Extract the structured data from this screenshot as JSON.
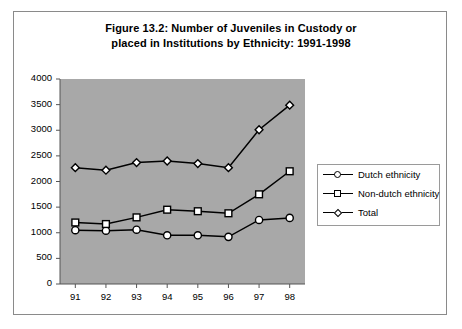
{
  "figure": {
    "title_line1": "Figure 13.2: Number of Juveniles in Custody or",
    "title_line2": "placed in Institutions by Ethnicity: 1991-1998"
  },
  "legend": {
    "position": "right-inside",
    "items": [
      {
        "label": "Dutch ethnicity",
        "marker": "circle"
      },
      {
        "label": "Non-dutch ethnicity",
        "marker": "square"
      },
      {
        "label": "Total",
        "marker": "diamond"
      }
    ]
  },
  "colors": {
    "plot_background": "#a8a8a8",
    "line": "#000000",
    "marker_fill": "#ffffff",
    "frame": "#8a8a8a",
    "text": "#000000"
  },
  "chart_data": {
    "type": "line",
    "title": "Figure 13.2: Number of Juveniles in Custody or placed in Institutions by Ethnicity: 1991-1998",
    "xlabel": "",
    "ylabel": "",
    "x": [
      "91",
      "92",
      "93",
      "94",
      "95",
      "96",
      "97",
      "98"
    ],
    "categories": [
      "91",
      "92",
      "93",
      "94",
      "95",
      "96",
      "97",
      "98"
    ],
    "tick_labels_y": [
      "0",
      "500",
      "1000",
      "1500",
      "2000",
      "2500",
      "3000",
      "3500",
      "4000"
    ],
    "ylim": [
      0,
      4000
    ],
    "ytick_step": 500,
    "grid": false,
    "series": [
      {
        "name": "Dutch ethnicity",
        "marker": "circle",
        "values": [
          1050,
          1040,
          1060,
          950,
          950,
          920,
          1250,
          1290
        ]
      },
      {
        "name": "Non-dutch ethnicity",
        "marker": "square",
        "values": [
          1200,
          1170,
          1300,
          1450,
          1420,
          1380,
          1750,
          2200
        ]
      },
      {
        "name": "Total",
        "marker": "diamond",
        "values": [
          2270,
          2220,
          2370,
          2400,
          2350,
          2270,
          3010,
          3490
        ]
      }
    ]
  },
  "axis": {
    "y_ticks": [
      0,
      500,
      1000,
      1500,
      2000,
      2500,
      3000,
      3500,
      4000
    ],
    "x_ticks": [
      "91",
      "92",
      "93",
      "94",
      "95",
      "96",
      "97",
      "98"
    ]
  }
}
